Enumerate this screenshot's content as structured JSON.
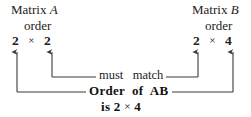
{
  "figure": {
    "kind": "matrix-multiplication-order-diagram",
    "left_block": {
      "title_prefix": "Matrix ",
      "title_symbol": "A",
      "order_label": "order",
      "rows": "2",
      "times": "×",
      "cols": "2"
    },
    "right_block": {
      "title_prefix": "Matrix ",
      "title_symbol": "B",
      "order_label": "order",
      "rows": "2",
      "times": "×",
      "cols": "4"
    },
    "inner_connector_caption": "must   match",
    "outer_connector_caption": "Order  of  AB",
    "result_prefix": "is 2 ",
    "result_times": "×",
    "result_cols": " 4",
    "ink_color": "#222222",
    "background_color": "#ffffff"
  }
}
